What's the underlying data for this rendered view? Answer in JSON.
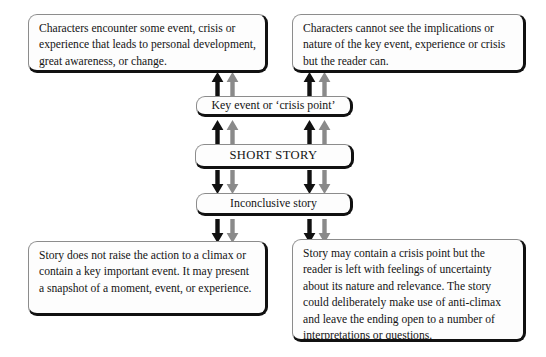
{
  "diagram": {
    "type": "flow-diagram",
    "background_color": "#ffffff",
    "box_border_color": "#8c8c8c",
    "box_shadow_color": "#111111",
    "arrow_black_color": "#111111",
    "arrow_gray_color": "#8a8a8a"
  },
  "boxes": {
    "top_left": {
      "id": "characters-encounter-event",
      "text": "Characters encounter some event, crisis or experience that leads to personal development, great awareness, or change."
    },
    "top_right": {
      "id": "characters-cannot-see-implications",
      "text": "Characters cannot see the implications or nature of the key event, experience or crisis but the reader can."
    },
    "center_top": {
      "id": "key-event-crisis-point",
      "text": "Key event or ‘crisis point’"
    },
    "center_middle": {
      "id": "short-story",
      "text": "SHORT STORY"
    },
    "center_bottom": {
      "id": "inconclusive-story",
      "text": "Inconclusive story"
    },
    "bottom_left": {
      "id": "story-does-not-raise-action",
      "text": "Story does not raise the action to a climax or contain a key important event. It may present a snapshot of a moment, event, or experience."
    },
    "bottom_right": {
      "id": "story-may-contain-crisis-point",
      "text": "Story may contain a crisis point but the reader is left with feelings of uncertainty about its nature and relevance. The story could deliberately make use of anti-climax and leave the ending open to a number of interpretations or questions."
    }
  },
  "arrows": [
    {
      "id": "key-event-to-top-left-black",
      "direction": "up",
      "color": "black"
    },
    {
      "id": "key-event-to-top-left-gray",
      "direction": "up",
      "color": "gray"
    },
    {
      "id": "key-event-to-top-right-black",
      "direction": "up",
      "color": "black"
    },
    {
      "id": "key-event-to-top-right-gray",
      "direction": "up",
      "color": "gray"
    },
    {
      "id": "short-story-to-key-event-left-black",
      "direction": "up",
      "color": "black"
    },
    {
      "id": "short-story-to-key-event-left-gray",
      "direction": "up",
      "color": "gray"
    },
    {
      "id": "short-story-to-key-event-right-black",
      "direction": "up",
      "color": "black"
    },
    {
      "id": "short-story-to-key-event-right-gray",
      "direction": "up",
      "color": "gray"
    },
    {
      "id": "short-story-to-inconclusive-left-black",
      "direction": "down",
      "color": "black"
    },
    {
      "id": "short-story-to-inconclusive-left-gray",
      "direction": "down",
      "color": "gray"
    },
    {
      "id": "short-story-to-inconclusive-right-black",
      "direction": "down",
      "color": "black"
    },
    {
      "id": "short-story-to-inconclusive-right-gray",
      "direction": "down",
      "color": "gray"
    },
    {
      "id": "inconclusive-to-bottom-left-black",
      "direction": "down",
      "color": "black"
    },
    {
      "id": "inconclusive-to-bottom-left-gray",
      "direction": "down",
      "color": "gray"
    },
    {
      "id": "inconclusive-to-bottom-right-black",
      "direction": "down",
      "color": "black"
    },
    {
      "id": "inconclusive-to-bottom-right-gray",
      "direction": "down",
      "color": "gray"
    }
  ]
}
